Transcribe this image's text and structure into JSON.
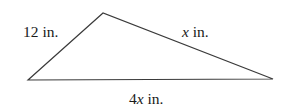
{
  "diagram": {
    "type": "triangle",
    "vertices": {
      "left": [
        28,
        80
      ],
      "top": [
        103,
        13
      ],
      "right": [
        273,
        79
      ]
    },
    "stroke_color": "#3a3a3a",
    "background": "#ffffff",
    "sides": [
      {
        "id": "left-side",
        "from": "left",
        "to": "top",
        "value": "12",
        "variable": "",
        "unit": " in."
      },
      {
        "id": "right-side",
        "from": "top",
        "to": "right",
        "value": "",
        "variable": "x",
        "unit": " in."
      },
      {
        "id": "base",
        "from": "left",
        "to": "right",
        "value": "4",
        "variable": "x",
        "unit": " in."
      }
    ]
  },
  "labels": {
    "left_side": {
      "number": "12",
      "unit": " in."
    },
    "right_side": {
      "variable": "x",
      "unit": " in."
    },
    "base": {
      "number": "4",
      "variable": "x",
      "unit": " in."
    }
  }
}
